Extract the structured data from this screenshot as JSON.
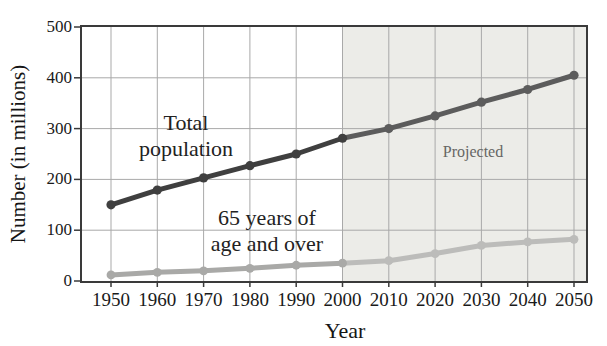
{
  "figure": {
    "y_axis_label": "Number (in millions)",
    "x_axis_label": "Year"
  },
  "annotations": {
    "total": [
      "Total",
      "population"
    ],
    "seniors": [
      "65 years of",
      "age and over"
    ],
    "projected": "Projected"
  },
  "chart_data": {
    "type": "line",
    "title": "",
    "xlabel": "Year",
    "ylabel": "Number (in millions)",
    "x": [
      1950,
      1960,
      1970,
      1980,
      1990,
      2000,
      2010,
      2020,
      2030,
      2040,
      2050
    ],
    "series": [
      {
        "name": "Total population",
        "values": [
          150,
          179,
          203,
          227,
          250,
          281,
          300,
          325,
          352,
          377,
          405
        ],
        "color": "#3f3f3f",
        "projected_color": "#5c5c5c"
      },
      {
        "name": "65 years of age and over",
        "values": [
          12,
          17,
          20,
          25,
          31,
          35,
          40,
          54,
          70,
          77,
          82
        ],
        "color": "#a9a9a7",
        "projected_color": "#bcbcba"
      }
    ],
    "ylim": [
      0,
      500
    ],
    "yticks": [
      0,
      100,
      200,
      300,
      400,
      500
    ],
    "grid": true,
    "gridline_color": "#a9a9a9",
    "projected_from_x": 2000,
    "projected_region_color": "#ecece8",
    "axis_color": "#3a3a3a",
    "legend_position": "inline annotations (no legend box)"
  }
}
